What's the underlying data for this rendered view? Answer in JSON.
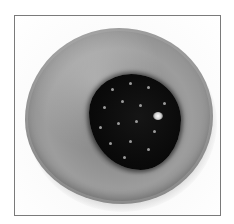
{
  "image": {
    "description": "Grayscale photo of a round glazed donut topped with a single blackberry in the center, inside a thin gray frame",
    "subject": "donut with blackberry",
    "colors": {
      "frame_border": "#7a7a7a",
      "background": "#ffffff",
      "donut": "#9d9d9d",
      "berry": "#0a0a0a"
    }
  }
}
